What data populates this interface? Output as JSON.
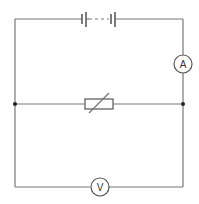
{
  "diagram": {
    "type": "circuit",
    "components": {
      "battery": {
        "label": "battery of cells",
        "position": "top"
      },
      "ammeter": {
        "label": "A",
        "position": "right"
      },
      "thermistor": {
        "label": "thermistor",
        "position": "middle"
      },
      "voltmeter": {
        "label": "V",
        "position": "bottom"
      }
    },
    "junctions": [
      "left",
      "right"
    ],
    "colors": {
      "wire": "#777777",
      "junction": "#222222"
    }
  }
}
